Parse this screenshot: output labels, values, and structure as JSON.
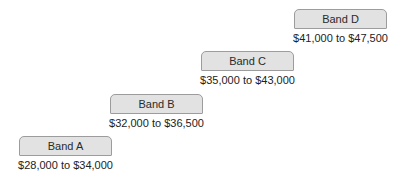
{
  "bands": [
    {
      "label": "Band A",
      "range": "$28,000 to $34,000"
    },
    {
      "label": "Band B",
      "range": "$32,000 to $36,500"
    },
    {
      "label": "Band C",
      "range": "$35,000 to $43,000"
    },
    {
      "label": "Band D",
      "range": "$41,000 to $47,500"
    }
  ],
  "colors": {
    "box_fill": "#e2e2e2",
    "box_border": "#9c9c9c",
    "text": "#222222"
  }
}
